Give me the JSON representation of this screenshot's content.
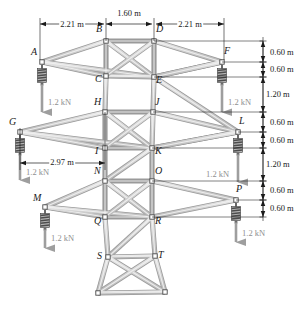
{
  "figure": {
    "colors": {
      "member_fill": "#d2d2d2",
      "member_edge": "#9a9a9a",
      "joint_fill": "#ffffff",
      "joint_edge": "#4a4a4a",
      "dimension_line": "#1a1a1a",
      "force_text": "#8f8f8f",
      "spring_dark": "#4d4d4d",
      "spring_light": "#b5b5b5",
      "arrow_gray": "#9e9e9e"
    }
  },
  "joints": [
    {
      "id": "A",
      "x": 42,
      "y": 62,
      "label_dx": -11,
      "label_dy": -10
    },
    {
      "id": "B",
      "x": 106,
      "y": 41,
      "label_dx": -10,
      "label_dy": -12
    },
    {
      "id": "C",
      "x": 106,
      "y": 76,
      "label_dx": -11,
      "label_dy": 3
    },
    {
      "id": "D",
      "x": 154,
      "y": 41,
      "label_dx": 2,
      "label_dy": -12
    },
    {
      "id": "E",
      "x": 154,
      "y": 77,
      "label_dx": 2,
      "label_dy": 3
    },
    {
      "id": "F",
      "x": 222,
      "y": 62,
      "label_dx": 2,
      "label_dy": -11
    },
    {
      "id": "G",
      "x": 20,
      "y": 132,
      "label_dx": -11,
      "label_dy": -10
    },
    {
      "id": "H",
      "x": 105,
      "y": 112,
      "label_dx": -11,
      "label_dy": -10
    },
    {
      "id": "I",
      "x": 105,
      "y": 148,
      "label_dx": -10,
      "label_dy": 3
    },
    {
      "id": "J",
      "x": 153,
      "y": 112,
      "label_dx": 2,
      "label_dy": -10
    },
    {
      "id": "K",
      "x": 152,
      "y": 148,
      "label_dx": 3,
      "label_dy": 3
    },
    {
      "id": "L",
      "x": 238,
      "y": 132,
      "label_dx": 1,
      "label_dy": -11
    },
    {
      "id": "M",
      "x": 45,
      "y": 207,
      "label_dx": -12,
      "label_dy": -9
    },
    {
      "id": "N",
      "x": 105,
      "y": 181,
      "label_dx": -11,
      "label_dy": -10
    },
    {
      "id": "O",
      "x": 152,
      "y": 181,
      "label_dx": 3,
      "label_dy": -10
    },
    {
      "id": "P",
      "x": 236,
      "y": 200,
      "label_dx": 0,
      "label_dy": -11
    },
    {
      "id": "Q",
      "x": 105,
      "y": 217,
      "label_dx": -11,
      "label_dy": 4
    },
    {
      "id": "R",
      "x": 152,
      "y": 217,
      "label_dx": 3,
      "label_dy": 4
    },
    {
      "id": "S",
      "x": 108,
      "y": 257,
      "label_dx": -11,
      "label_dy": -1
    },
    {
      "id": "T",
      "x": 155,
      "y": 256,
      "label_dx": 3,
      "label_dy": -1
    },
    {
      "id": "U",
      "x": 98,
      "y": 293,
      "label_dx": 0,
      "label_dy": 0
    },
    {
      "id": "V",
      "x": 165,
      "y": 292,
      "label_dx": 0,
      "label_dy": 0
    }
  ],
  "members": [
    [
      "A",
      "B"
    ],
    [
      "A",
      "C"
    ],
    [
      "A",
      "E"
    ],
    [
      "B",
      "C"
    ],
    [
      "B",
      "D"
    ],
    [
      "B",
      "E"
    ],
    [
      "C",
      "E"
    ],
    [
      "C",
      "H"
    ],
    [
      "D",
      "E"
    ],
    [
      "D",
      "F"
    ],
    [
      "E",
      "F"
    ],
    [
      "E",
      "J"
    ],
    [
      "C",
      "D"
    ],
    [
      "E",
      "L"
    ],
    [
      "F",
      "E"
    ],
    [
      "G",
      "H"
    ],
    [
      "G",
      "I"
    ],
    [
      "G",
      "K"
    ],
    [
      "H",
      "I"
    ],
    [
      "H",
      "J"
    ],
    [
      "H",
      "K"
    ],
    [
      "I",
      "K"
    ],
    [
      "I",
      "N"
    ],
    [
      "J",
      "K"
    ],
    [
      "J",
      "L"
    ],
    [
      "K",
      "L"
    ],
    [
      "K",
      "O"
    ],
    [
      "I",
      "J"
    ],
    [
      "L",
      "K"
    ],
    [
      "M",
      "N"
    ],
    [
      "M",
      "Q"
    ],
    [
      "M",
      "R"
    ],
    [
      "N",
      "O"
    ],
    [
      "N",
      "Q"
    ],
    [
      "N",
      "R"
    ],
    [
      "O",
      "R"
    ],
    [
      "O",
      "P"
    ],
    [
      "P",
      "R"
    ],
    [
      "Q",
      "R"
    ],
    [
      "Q",
      "S"
    ],
    [
      "R",
      "T"
    ],
    [
      "N",
      "K"
    ],
    [
      "Q",
      "O"
    ],
    [
      "S",
      "T"
    ],
    [
      "S",
      "R"
    ],
    [
      "S",
      "U"
    ],
    [
      "T",
      "V"
    ],
    [
      "S",
      "V"
    ],
    [
      "T",
      "U"
    ],
    [
      "U",
      "V"
    ]
  ],
  "loads": [
    {
      "at": "A",
      "label": "1.2 kN",
      "tip_y": 112,
      "text_x": 48,
      "text_y": 98
    },
    {
      "at": "F",
      "label": "1.2 kN",
      "tip_y": 112,
      "text_x": 228,
      "text_y": 98
    },
    {
      "at": "G",
      "label": "1.2 kN",
      "tip_y": 180,
      "text_x": 26,
      "text_y": 168
    },
    {
      "at": "L",
      "label": "1.2 kN",
      "tip_y": 182,
      "text_x": 206,
      "text_y": 170
    },
    {
      "at": "M",
      "label": "1.2 kN",
      "tip_y": 248,
      "text_x": 51,
      "text_y": 234
    },
    {
      "at": "P",
      "label": "1.2 kN",
      "tip_y": 242,
      "text_x": 242,
      "text_y": 229
    }
  ],
  "horizontal_dimensions": [
    {
      "label": "2.21 m",
      "x1": 40,
      "x2": 104,
      "y": 24,
      "text_x": 72,
      "text_y": 20
    },
    {
      "label": "1.60 m",
      "x1": 106,
      "x2": 152,
      "y": 24,
      "text_x": 129,
      "text_y": 9
    },
    {
      "label": "2.21 m",
      "x1": 156,
      "x2": 224,
      "y": 24,
      "text_x": 190,
      "text_y": 20
    },
    {
      "label": "2.97 m",
      "x1": 20,
      "x2": 105,
      "y": 163,
      "text_x": 62,
      "text_y": 158
    }
  ],
  "vertical_dimensions": [
    {
      "label": "0.60 m",
      "y1": 41,
      "y2": 62,
      "x": 263,
      "text_x": 270,
      "text_y": 48
    },
    {
      "label": "0.60 m",
      "y1": 62,
      "y2": 77,
      "x": 263,
      "text_x": 270,
      "text_y": 65
    },
    {
      "label": "1.20 m",
      "y1": 77,
      "y2": 112,
      "x": 263,
      "text_x": 266,
      "text_y": 90
    },
    {
      "label": "0.60 m",
      "y1": 112,
      "y2": 132,
      "x": 263,
      "text_x": 270,
      "text_y": 118
    },
    {
      "label": "0.60 m",
      "y1": 132,
      "y2": 148,
      "x": 263,
      "text_x": 270,
      "text_y": 136
    },
    {
      "label": "1.20 m",
      "y1": 148,
      "y2": 181,
      "x": 263,
      "text_x": 266,
      "text_y": 160
    },
    {
      "label": "0.60 m",
      "y1": 181,
      "y2": 200,
      "x": 263,
      "text_x": 270,
      "text_y": 186
    },
    {
      "label": "0.60 m",
      "y1": 200,
      "y2": 217,
      "x": 263,
      "text_x": 270,
      "text_y": 204
    }
  ],
  "leader_lines": [
    {
      "x1": 154,
      "x2": 263,
      "y": 41
    },
    {
      "x1": 222,
      "x2": 263,
      "y": 62
    },
    {
      "x1": 154,
      "x2": 263,
      "y": 77
    },
    {
      "x1": 153,
      "x2": 263,
      "y": 112
    },
    {
      "x1": 238,
      "x2": 263,
      "y": 132
    },
    {
      "x1": 152,
      "x2": 263,
      "y": 148
    },
    {
      "x1": 152,
      "x2": 263,
      "y": 181
    },
    {
      "x1": 236,
      "x2": 263,
      "y": 200
    },
    {
      "x1": 152,
      "x2": 263,
      "y": 217
    }
  ],
  "extension_lines": [
    {
      "x": 40,
      "y1": 18,
      "y2": 60
    },
    {
      "x": 106,
      "y1": 18,
      "y2": 41
    },
    {
      "x": 154,
      "y1": 18,
      "y2": 41
    },
    {
      "x": 224,
      "y1": 18,
      "y2": 60
    },
    {
      "x": 20,
      "y1": 128,
      "y2": 170
    },
    {
      "x": 105,
      "y1": 112,
      "y2": 170
    }
  ]
}
